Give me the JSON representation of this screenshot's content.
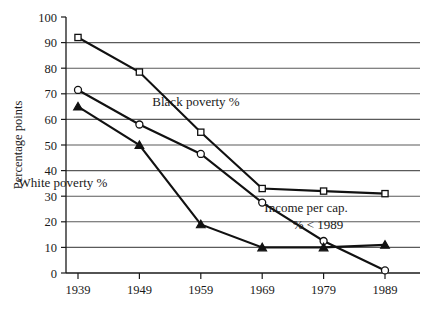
{
  "chart_data": {
    "type": "line",
    "title": "",
    "xlabel": "",
    "ylabel": "Percentage points",
    "categories": [
      "1939",
      "1949",
      "1959",
      "1969",
      "1979",
      "1989"
    ],
    "x": [
      1939,
      1949,
      1959,
      1969,
      1979,
      1989
    ],
    "xlim": [
      1939,
      1989
    ],
    "ylim": [
      0,
      100
    ],
    "yticks": [
      "0",
      "10",
      "20",
      "30",
      "40",
      "50",
      "60",
      "70",
      "80",
      "90",
      "100"
    ],
    "ytick_values": [
      0,
      10,
      20,
      30,
      40,
      50,
      60,
      70,
      80,
      90,
      100
    ],
    "grid": "horizontal",
    "legend_position": "inline-annotations",
    "series": [
      {
        "name": "Black poverty %",
        "marker": "open-square",
        "values": [
          92,
          78.5,
          55,
          33,
          32,
          31
        ]
      },
      {
        "name": "Income per cap. % < 1989",
        "marker": "open-circle",
        "values": [
          71.5,
          58,
          46.5,
          27.5,
          12.5,
          1
        ]
      },
      {
        "name": "White poverty %",
        "marker": "filled-triangle",
        "values": [
          65,
          50,
          19,
          10,
          10,
          11
        ]
      }
    ],
    "annotations": [
      {
        "id": "black-poverty",
        "text": "Black poverty %",
        "x": 196,
        "y": 106
      },
      {
        "id": "white-poverty",
        "text": "White poverty %",
        "x": 63,
        "y": 187
      },
      {
        "id": "income-per-cap-line1",
        "text": "Income per cap.",
        "x": 306,
        "y": 212
      },
      {
        "id": "income-per-cap-line2",
        "text": "% < 1989",
        "x": 318,
        "y": 229
      }
    ]
  },
  "colors": {
    "ink": "#111111",
    "gridline": "#5a5a5a",
    "background": "#ffffff"
  }
}
